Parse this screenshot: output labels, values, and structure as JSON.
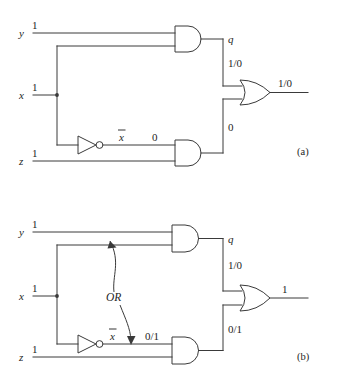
{
  "figure": {
    "type": "logic-circuit-diagram",
    "panels": [
      {
        "id": "a",
        "caption": "(a)",
        "inputs": [
          {
            "name": "y",
            "value": "1"
          },
          {
            "name": "x",
            "value": "1"
          },
          {
            "name": "z",
            "value": "1"
          }
        ],
        "internal_labels": {
          "inverter_output": "x̅",
          "inverter_output_plain": "x",
          "and_top_output_name": "q",
          "and_top_output_value": "1/0",
          "and_bottom_input_value": "0",
          "and_bottom_output_value": "0"
        },
        "final_output": "1/0",
        "gates": [
          {
            "kind": "and-gate",
            "name": "and-gate-top"
          },
          {
            "kind": "and-gate",
            "name": "and-gate-bottom"
          },
          {
            "kind": "not-gate",
            "name": "inverter"
          },
          {
            "kind": "or-gate",
            "name": "or-gate-output"
          }
        ]
      },
      {
        "id": "b",
        "caption": "(b)",
        "inputs": [
          {
            "name": "y",
            "value": "1"
          },
          {
            "name": "x",
            "value": "1"
          },
          {
            "name": "z",
            "value": "1"
          }
        ],
        "internal_labels": {
          "inverter_output": "x̅",
          "inverter_output_plain": "x",
          "and_top_output_name": "q",
          "and_top_output_value": "1/0",
          "and_bottom_input_value": "0/1",
          "and_bottom_output_value": "0/1"
        },
        "annotation": "OR",
        "final_output": "1",
        "gates": [
          {
            "kind": "and-gate",
            "name": "and-gate-top"
          },
          {
            "kind": "and-gate",
            "name": "and-gate-bottom"
          },
          {
            "kind": "not-gate",
            "name": "inverter"
          },
          {
            "kind": "or-gate",
            "name": "or-gate-output"
          }
        ]
      }
    ]
  },
  "colors": {
    "ink": "#3a3a3a",
    "text": "#1e1e1e",
    "background": "#ffffff"
  }
}
